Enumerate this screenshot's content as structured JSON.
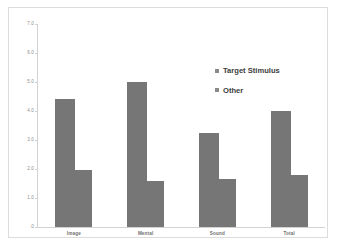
{
  "chart_data": {
    "type": "bar",
    "title": "",
    "subtitle": "",
    "xlabel": "",
    "ylabel": "",
    "categories": [
      "Image",
      "Mental",
      "Sound",
      "Total"
    ],
    "series": [
      {
        "name": "Target Stimulus",
        "values": [
          4.4,
          5.0,
          3.25,
          4.0
        ]
      },
      {
        "name": "Other",
        "values": [
          1.95,
          1.6,
          1.65,
          1.8
        ]
      }
    ],
    "ylim": [
      0.0,
      7.0
    ],
    "ytick_labels": [
      "7.0",
      "6.0",
      "5.0",
      "4.0",
      "3.0",
      "2.0",
      "1.0",
      ".0"
    ],
    "ytick_values": [
      7.0,
      6.0,
      5.0,
      4.0,
      3.0,
      2.0,
      1.0,
      0.0
    ],
    "grid": false,
    "legend_position": "upper-right-inside",
    "legend_entries": [
      "Target Stimulus",
      "Other"
    ],
    "annotations": [],
    "colors": {
      "bar_fill": "#767676",
      "legend_swatch": "#8a8a8a",
      "axis_line": "#d2d2d2",
      "tick_label": "#8d8d8d",
      "category_label": "#6f6f6f",
      "legend_text": "#3d3d3d",
      "frame_border": "#dcdcdc",
      "plot_background": "#ffffff"
    }
  }
}
